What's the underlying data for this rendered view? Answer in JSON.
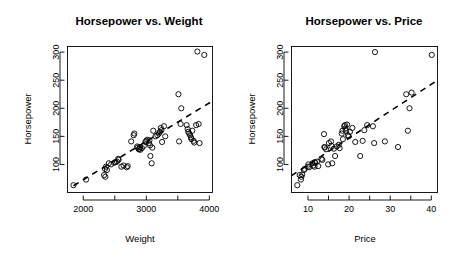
{
  "figure": {
    "width": 451,
    "height": 255,
    "background": "#ffffff",
    "foreground": "#000000",
    "panel_count": 2
  },
  "chart_data": [
    {
      "type": "scatter",
      "id": "horsepower-vs-weight",
      "title": "Horsepower vs. Weight",
      "xlabel": "Weight",
      "ylabel": "Horsepower",
      "xlim": [
        1750,
        4050
      ],
      "ylim": [
        50,
        310
      ],
      "grid": false,
      "legend": null,
      "xticks": [
        2000,
        2500,
        3000,
        3500,
        4000
      ],
      "xtick_labels": [
        "2000",
        "",
        "3000",
        "",
        "4000"
      ],
      "yticks": [
        100,
        150,
        200,
        250,
        300
      ],
      "ytick_labels": [
        "100",
        "150",
        "200",
        "250",
        "300"
      ],
      "marker": "open-circle",
      "x": [
        1845,
        2045,
        2330,
        2345,
        2350,
        2360,
        2375,
        2405,
        2440,
        2490,
        2510,
        2535,
        2555,
        2560,
        2605,
        2640,
        2690,
        2705,
        2760,
        2800,
        2810,
        2855,
        2865,
        2880,
        2890,
        2900,
        2905,
        2930,
        2960,
        2985,
        3000,
        3015,
        3040,
        3050,
        3060,
        3065,
        3085,
        3095,
        3110,
        3145,
        3175,
        3200,
        3215,
        3230,
        3240,
        3250,
        3280,
        3300,
        3510,
        3520,
        3545,
        3555,
        3640,
        3655,
        3665,
        3680,
        3695,
        3710,
        3715,
        3730,
        3750,
        3760,
        3790,
        3810,
        3830,
        3845,
        3920
      ],
      "y": [
        63,
        73,
        81,
        92,
        78,
        96,
        90,
        102,
        100,
        103,
        104,
        105,
        110,
        108,
        96,
        98,
        95,
        97,
        141,
        152,
        155,
        132,
        130,
        127,
        128,
        131,
        126,
        129,
        133,
        140,
        142,
        144,
        138,
        143,
        134,
        115,
        102,
        130,
        160,
        150,
        152,
        155,
        158,
        165,
        161,
        140,
        168,
        150,
        225,
        141,
        172,
        200,
        170,
        163,
        158,
        155,
        152,
        148,
        145,
        160,
        142,
        139,
        170,
        301,
        172,
        138,
        295
      ],
      "fit_line": {
        "x0": 1845,
        "y0": 62,
        "x1": 4050,
        "y1": 213,
        "style": "dashed"
      }
    },
    {
      "type": "scatter",
      "id": "horsepower-vs-price",
      "title": "Horsepower vs. Price",
      "xlabel": "Price",
      "ylabel": "Horsepower",
      "xlim": [
        6.0,
        41.5
      ],
      "ylim": [
        50,
        310
      ],
      "grid": false,
      "legend": null,
      "xticks": [
        10,
        15,
        20,
        25,
        30,
        35,
        40
      ],
      "xtick_labels": [
        "10",
        "",
        "20",
        "",
        "30",
        "",
        "40"
      ],
      "yticks": [
        100,
        150,
        200,
        250,
        300
      ],
      "ytick_labels": [
        "100",
        "150",
        "200",
        "250",
        "300"
      ],
      "marker": "open-circle",
      "x": [
        7.4,
        8.0,
        8.3,
        8.4,
        8.6,
        9.0,
        9.2,
        10.0,
        10.1,
        10.3,
        11.1,
        11.3,
        11.6,
        11.6,
        11.8,
        12.2,
        12.5,
        13.3,
        13.5,
        13.9,
        14.0,
        14.1,
        14.4,
        14.9,
        15.1,
        15.6,
        15.7,
        15.9,
        16.3,
        16.6,
        17.0,
        17.5,
        17.7,
        18.2,
        18.4,
        18.5,
        18.8,
        19.0,
        19.1,
        19.3,
        19.5,
        19.7,
        19.9,
        20.2,
        20.8,
        21.5,
        22.7,
        23.3,
        23.7,
        24.4,
        25.8,
        26.1,
        26.3,
        28.7,
        31.9,
        33.9,
        34.3,
        34.7,
        35.2,
        40.1
      ],
      "y": [
        63,
        81,
        73,
        78,
        82,
        90,
        92,
        96,
        100,
        95,
        102,
        98,
        104,
        96,
        103,
        105,
        97,
        110,
        108,
        154,
        131,
        130,
        127,
        100,
        138,
        141,
        133,
        102,
        128,
        115,
        132,
        135,
        129,
        155,
        160,
        145,
        168,
        170,
        164,
        160,
        171,
        152,
        150,
        158,
        165,
        140,
        115,
        142,
        161,
        170,
        168,
        138,
        300,
        141,
        131,
        225,
        160,
        200,
        228,
        295
      ],
      "fit_line": {
        "x0": 6.0,
        "y0": 80,
        "x1": 41.5,
        "y1": 250,
        "style": "dashed"
      }
    }
  ]
}
